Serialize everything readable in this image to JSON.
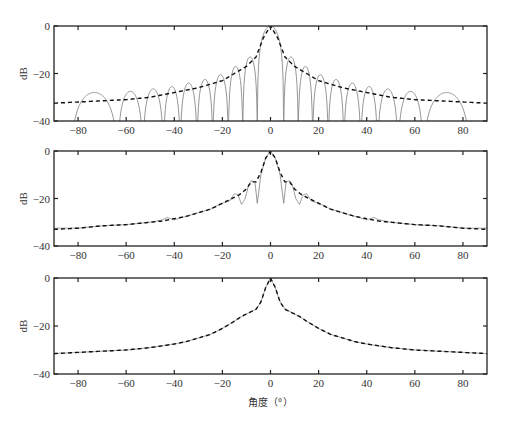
{
  "chart_data": [
    {
      "type": "line",
      "panel": "top",
      "title": "",
      "xlabel": "",
      "ylabel": "dB",
      "xlim": [
        -90,
        90
      ],
      "ylim": [
        -40,
        0
      ],
      "xticks": [
        -80,
        -60,
        -40,
        -20,
        0,
        20,
        40,
        60,
        80
      ],
      "yticks": [
        0,
        -20,
        -40
      ],
      "grid": false,
      "series": [
        {
          "name": "solid-pattern",
          "style": "solid",
          "color": "#8a8a8a",
          "description": "Symmetric sinc-like beam pattern with main lobe at 0 and deep nulls",
          "nulls_deg": [
            5.5,
            11.5,
            17.5,
            24,
            30.5,
            37.5,
            44.5,
            53,
            63.5,
            83
          ],
          "lobe_peaks_db": [
            0,
            -13,
            -17,
            -20.5,
            -22.5,
            -24,
            -25.5,
            -26.5,
            -27.5,
            -28,
            -29.5
          ]
        },
        {
          "name": "dashed-envelope",
          "style": "dashed",
          "color": "#111111",
          "x": [
            0,
            3,
            6,
            10,
            20,
            30,
            40,
            50,
            60,
            70,
            80,
            90
          ],
          "y": [
            0,
            -5,
            -13,
            -17,
            -23,
            -26,
            -28,
            -30,
            -31,
            -31.5,
            -32,
            -32.5
          ]
        }
      ]
    },
    {
      "type": "line",
      "panel": "middle",
      "title": "",
      "xlabel": "",
      "ylabel": "dB",
      "xlim": [
        -90,
        90
      ],
      "ylim": [
        -40,
        0
      ],
      "xticks": [
        -80,
        -60,
        -40,
        -20,
        0,
        20,
        40,
        60,
        80
      ],
      "yticks": [
        0,
        -20,
        -40
      ],
      "grid": false,
      "series": [
        {
          "name": "solid-pattern",
          "style": "solid",
          "color": "#8a8a8a",
          "x": [
            0,
            2,
            4,
            5.5,
            6.5,
            8,
            9,
            10.5,
            12,
            13.5,
            15,
            17,
            20,
            25,
            30,
            35,
            40,
            43,
            45,
            50,
            60,
            70,
            80,
            90
          ],
          "y": [
            0,
            -3,
            -10,
            -22,
            -13,
            -12.5,
            -14,
            -20,
            -22.5,
            -18.5,
            -18,
            -21,
            -22,
            -24.5,
            -26,
            -27.5,
            -29,
            -28,
            -29,
            -30,
            -31,
            -31.5,
            -32.5,
            -32.5
          ]
        },
        {
          "name": "dashed-envelope",
          "style": "dashed",
          "color": "#111111",
          "x": [
            0,
            2,
            4,
            6,
            8,
            10,
            13,
            15,
            20,
            25,
            30,
            35,
            40,
            45,
            50,
            60,
            70,
            80,
            90
          ],
          "y": [
            0,
            -3,
            -9,
            -13,
            -13,
            -16,
            -18.5,
            -19.5,
            -22,
            -24.5,
            -26,
            -27.5,
            -28.5,
            -29.5,
            -30,
            -31,
            -31.5,
            -32.5,
            -33
          ]
        }
      ]
    },
    {
      "type": "line",
      "panel": "bottom",
      "title": "",
      "xlabel": "角度（°）",
      "ylabel": "dB",
      "xlim": [
        -90,
        90
      ],
      "ylim": [
        -40,
        0
      ],
      "xticks": [
        -80,
        -60,
        -40,
        -20,
        0,
        20,
        40,
        60,
        80
      ],
      "yticks": [
        0,
        -20,
        -40
      ],
      "grid": false,
      "series": [
        {
          "name": "solid-pattern",
          "style": "solid",
          "color": "#8a8a8a",
          "x": [
            0,
            2,
            4,
            6,
            8,
            10,
            12,
            15,
            20,
            25,
            30,
            35,
            40,
            50,
            60,
            70,
            80,
            90
          ],
          "y": [
            0,
            -4,
            -10,
            -13,
            -14,
            -15,
            -16,
            -18,
            -21,
            -23.5,
            -25,
            -26.5,
            -27.5,
            -29,
            -30,
            -30.5,
            -31,
            -31.5
          ]
        },
        {
          "name": "dashed-envelope",
          "style": "dashed",
          "color": "#111111",
          "x": [
            0,
            2,
            4,
            6,
            8,
            10,
            12,
            15,
            20,
            25,
            30,
            35,
            40,
            50,
            60,
            70,
            80,
            90
          ],
          "y": [
            0,
            -4,
            -10,
            -13,
            -14,
            -15,
            -16,
            -18,
            -21,
            -23.5,
            -25,
            -26.5,
            -27.5,
            -29,
            -30,
            -30.5,
            -31,
            -31.5
          ]
        }
      ]
    }
  ],
  "panels": [
    {
      "ylabel": "dB",
      "yticks": [
        "0",
        "-20",
        "-40"
      ],
      "xticks": [
        "-80",
        "-60",
        "-40",
        "-20",
        "0",
        "20",
        "40",
        "60",
        "80"
      ]
    },
    {
      "ylabel": "dB",
      "yticks": [
        "0",
        "-20",
        "-40"
      ],
      "xticks": [
        "-80",
        "-60",
        "-40",
        "-20",
        "0",
        "20",
        "40",
        "60",
        "80"
      ]
    },
    {
      "ylabel": "dB",
      "yticks": [
        "0",
        "-20",
        "-40"
      ],
      "xticks": [
        "-80",
        "-60",
        "-40",
        "-20",
        "0",
        "20",
        "40",
        "60",
        "80"
      ]
    }
  ],
  "xlabel": "角度（°）",
  "colors": {
    "solid": "#8a8a8a",
    "dashed": "#111111",
    "axes": "#222222"
  }
}
